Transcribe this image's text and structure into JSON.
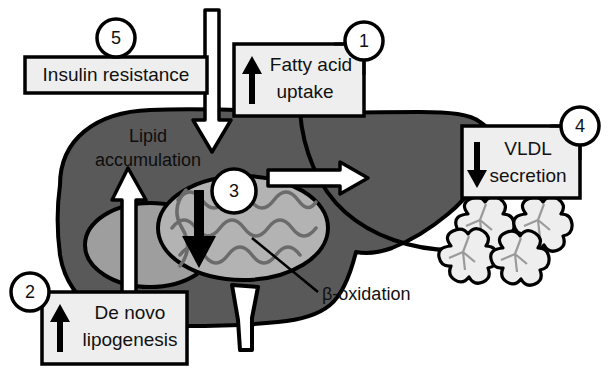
{
  "figure": {
    "background_color": "#ffffff",
    "liver_color": "#595959",
    "liver_lobe_color": "#9e9e9e",
    "mitochondria_color": "#b3b3b3",
    "box_fill": "#eeeeee",
    "outline_color": "#000000"
  },
  "boxes": [
    {
      "id": "fatty-acid-uptake",
      "number": "1",
      "line1": "Fatty acid",
      "line2": "uptake",
      "arrow_direction": "up",
      "arrow_symbol": "↑"
    },
    {
      "id": "de-novo-lipogenesis",
      "number": "2",
      "line1": "De novo",
      "line2": "lipogenesis",
      "arrow_direction": "up",
      "arrow_symbol": "↑"
    },
    {
      "id": "vldl-secretion",
      "number": "4",
      "line1": "VLDL",
      "line2": "secretion",
      "arrow_direction": "down",
      "arrow_symbol": "↓"
    },
    {
      "id": "insulin-resistance",
      "number": "5",
      "line1": "Insulin resistance",
      "line2": "",
      "arrow_direction": "none",
      "arrow_symbol": ""
    }
  ],
  "mitochondria": {
    "number": "3",
    "label": "β-oxidation",
    "arrow_direction": "down",
    "arrow_symbol": "↓"
  },
  "liver": {
    "label_line1": "Lipid",
    "label_line2": "accumulation"
  },
  "arrows": {
    "uptake_into_liver": "down",
    "lipogenesis_into_liver": "up",
    "vldl_out_of_liver": "right"
  },
  "vldl_particles": {
    "count": 4
  }
}
